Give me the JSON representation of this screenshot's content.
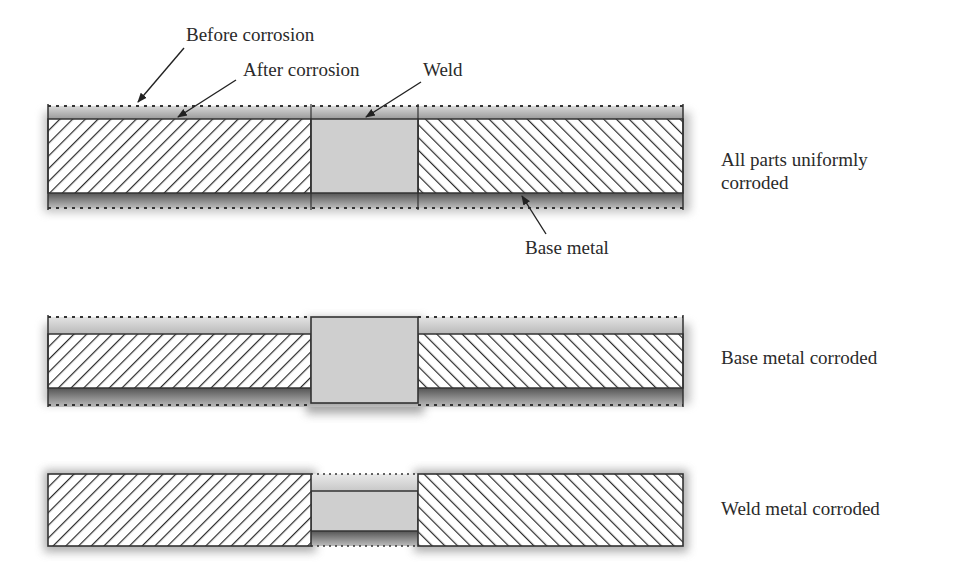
{
  "labels": {
    "before_corrosion": "Before corrosion",
    "after_corrosion": "After corrosion",
    "weld": "Weld",
    "base_metal": "Base metal"
  },
  "cases": [
    {
      "id": "uniform",
      "caption_line1": "All parts uniformly",
      "caption_line2": "corroded"
    },
    {
      "id": "base",
      "caption_line1": "Base metal corroded"
    },
    {
      "id": "weld",
      "caption_line1": "Weld metal corroded"
    }
  ],
  "colors": {
    "outline": "#333333",
    "weld_fill": "#cfcfcf",
    "corrosion_shadow": "#8a8a8a",
    "hatch": "#2b2b2b"
  }
}
